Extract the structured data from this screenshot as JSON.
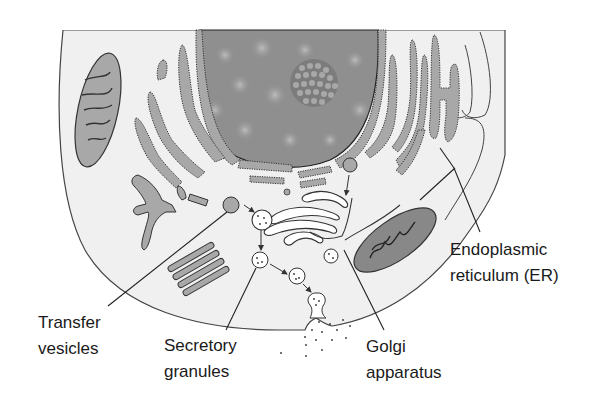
{
  "diagram": {
    "type": "biological-cell-cross-section",
    "colors": {
      "background": "#ffffff",
      "cytoplasm": "#f0f0f0",
      "organelle_fill": "#a8a8a8",
      "nucleus_fill": "#8f8f8f",
      "nucleus_blob": "#b4b4b4",
      "nucleolus": "#7c7c7c",
      "outline": "#333333",
      "leader_line": "#222222",
      "text": "#1a1a1a"
    },
    "structures": [
      "nucleus",
      "nucleolus",
      "rough-endoplasmic-reticulum",
      "mitochondrion-left",
      "mitochondrion-right",
      "golgi-apparatus",
      "transfer-vesicle",
      "secretory-granules",
      "smooth-er-stack",
      "cell-membrane",
      "secreted-particles"
    ],
    "flow_arrows": [
      "transfer-vesicle -> golgi",
      "er-vesicle -> golgi",
      "golgi -> secretory-granule",
      "secretory-granule -> secretory-granule",
      "secretory-granule -> exocytosis"
    ]
  },
  "labels": {
    "transfer_vesicles": {
      "line1": "Transfer",
      "line2": "vesicles"
    },
    "secretory_granules": {
      "line1": "Secretory",
      "line2": "granules"
    },
    "golgi_apparatus": {
      "line1": "Golgi",
      "line2": "apparatus"
    },
    "endoplasmic_reticulum": {
      "line1": "Endoplasmic",
      "line2": "reticulum (ER)"
    }
  }
}
